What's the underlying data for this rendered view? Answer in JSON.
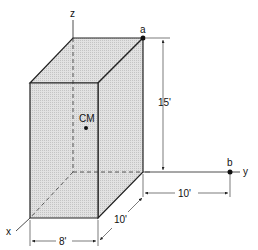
{
  "diagram": {
    "axes": {
      "x": "x",
      "y": "y",
      "z": "z"
    },
    "points": {
      "a": "a",
      "b": "b",
      "cm": "CM"
    },
    "dimensions": {
      "height": "15'",
      "width": "8'",
      "depth": "10'",
      "offset_b": "10'"
    },
    "colors": {
      "face": "#d4d4d4",
      "stroke": "#222222"
    }
  }
}
